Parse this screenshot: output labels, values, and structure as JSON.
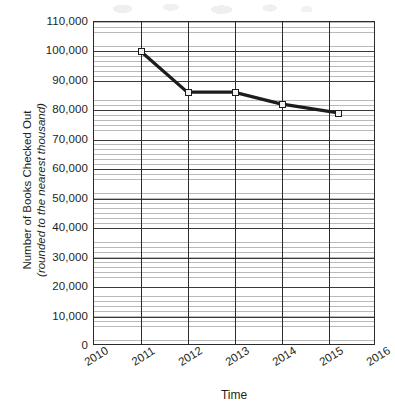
{
  "chart_data": {
    "type": "line",
    "title": "",
    "xlabel": "Time",
    "ylabel": "Number of Books Checked Out (rounded to the nearest thousand)",
    "ylabel_line1": "Number of Books Checked Out",
    "ylabel_line2": "(rounded to the nearest thousand)",
    "x": [
      2011,
      2012,
      2013,
      2014,
      2015.2
    ],
    "values": [
      100000,
      86000,
      86000,
      82000,
      79000
    ],
    "series": [
      {
        "name": "Books Checked Out",
        "points": [
          {
            "x": 2011,
            "y": 100000
          },
          {
            "x": 2012,
            "y": 86000
          },
          {
            "x": 2013,
            "y": 86000
          },
          {
            "x": 2014,
            "y": 82000
          },
          {
            "x": 2015.2,
            "y": 79000
          }
        ]
      }
    ],
    "xlim": [
      2010,
      2016
    ],
    "ylim": [
      0,
      110000
    ],
    "xticks": [
      2010,
      2011,
      2012,
      2013,
      2014,
      2015,
      2016
    ],
    "xtick_labels": [
      "2010",
      "2011",
      "2012",
      "2013",
      "2014",
      "2015",
      "2016"
    ],
    "yticks": [
      0,
      10000,
      20000,
      30000,
      40000,
      50000,
      60000,
      70000,
      80000,
      90000,
      100000,
      110000
    ],
    "ytick_labels": [
      "0",
      "10,000",
      "20,000",
      "30,000",
      "40,000",
      "50,000",
      "60,000",
      "70,000",
      "80,000",
      "90,000",
      "100,000",
      "110,000"
    ],
    "grid": {
      "major_horizontal": true,
      "minor_horizontal": true,
      "vertical": true,
      "minor_per_division": 6
    },
    "legend": {
      "visible": false,
      "position": "none"
    },
    "marker": "open-square",
    "colors": {
      "line": "#1c1c1c",
      "marker_fill": "#f2f2f2",
      "marker_edge": "#1c1c1c",
      "major_grid": "#3a3a3a",
      "minor_grid": "#b9b9b9",
      "axis": "#2b2b2b",
      "text": "#231f20",
      "background": "#ffffff"
    }
  }
}
